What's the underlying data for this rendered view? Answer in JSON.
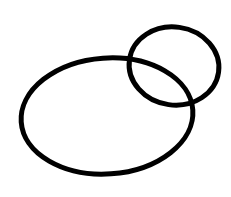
{
  "canvas": {
    "width": 231,
    "height": 197,
    "background": "#ffffff"
  },
  "stroke": {
    "color": "#000000",
    "width": 5
  },
  "shapes": [
    {
      "name": "large-ellipse",
      "cx": 107,
      "cy": 116,
      "rx": 86,
      "ry": 58,
      "rotate": -4
    },
    {
      "name": "small-ellipse",
      "cx": 174,
      "cy": 66,
      "rx": 45,
      "ry": 39,
      "rotate": 8
    }
  ]
}
